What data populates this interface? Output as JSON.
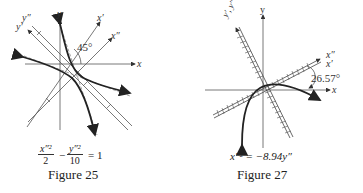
{
  "figures": [
    {
      "id": "figure-25",
      "caption": "Figure 25",
      "equation": {
        "term1_num": "x″²",
        "term1_den": "2",
        "minus": "−",
        "term2_num": "y″²",
        "term2_den": "10",
        "rhs": "= 1"
      },
      "axis_labels": {
        "x": "x",
        "y": "y",
        "x_prime": "x′",
        "x_dprime": "x″",
        "y_prime": "y′",
        "y_dprime": "y″"
      },
      "angle_label": "45°"
    },
    {
      "id": "figure-27",
      "caption": "Figure 27",
      "equation": {
        "text": "x″² = −8.94y″"
      },
      "axis_labels": {
        "x": "x",
        "y": "y",
        "x_pair": "x″",
        "x_prime": "x′",
        "y_pair": "y′, y″"
      },
      "angle_label": "26.57°"
    }
  ]
}
